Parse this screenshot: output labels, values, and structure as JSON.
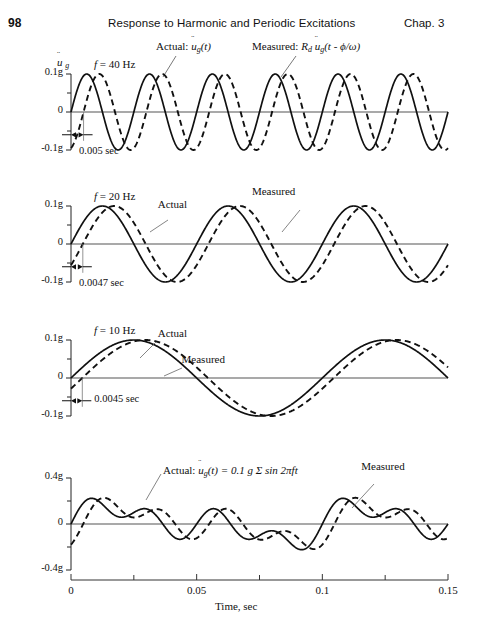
{
  "page": {
    "folio": "98",
    "running_title": "Response to Harmonic and Periodic Excitations",
    "chapter": "Chap. 3"
  },
  "legend": {
    "actual_prefix": "Actual:",
    "actual_symbol_u": "u",
    "actual_symbol_sub": "g",
    "actual_symbol_arg": "(t)",
    "measured_prefix": "Measured:",
    "measured_rd": "R",
    "measured_rd_sub": "d",
    "measured_symbol_u": "u",
    "measured_symbol_sub": "g",
    "measured_symbol_arg": "(t - ϕ/ω)"
  },
  "axis": {
    "x_title": "Time, sec",
    "x_ticks": [
      "0",
      "0.05",
      "0.1",
      "0.15"
    ],
    "x_tick_values": [
      0,
      0.05,
      0.1,
      0.15
    ],
    "x_minor_values": [
      0.025,
      0.075,
      0.125
    ],
    "x_min": 0,
    "x_max": 0.15,
    "y_name_u": "u",
    "y_name_sub": "g"
  },
  "chart_data": [
    {
      "id": "panel-40hz",
      "type": "line",
      "title": "f = 40 Hz",
      "freq_label_prefix": "f",
      "freq_label_value": "= 40 Hz",
      "frequency_hz": 40,
      "amplitude_g": 0.1,
      "phase_shift_sec": 0.005,
      "shift_label": "0.005 sec",
      "xlabel": "",
      "ylabel": "",
      "xlim": [
        0,
        0.15
      ],
      "ylim": [
        -0.1,
        0.1
      ],
      "y_ticks": [
        "0.1g",
        "0",
        "-0.1g"
      ],
      "y_tick_values": [
        0.1,
        0,
        -0.1
      ],
      "y_minor_values": [
        0.05,
        -0.05
      ],
      "grid": false,
      "series": [
        {
          "name": "Actual",
          "style": "solid",
          "type": "sine",
          "amplitude": 0.1,
          "freq": 40,
          "shift": 0
        },
        {
          "name": "Measured",
          "style": "dashed",
          "type": "sine",
          "amplitude": 0.1,
          "freq": 40,
          "shift": 0.005
        }
      ],
      "annotations": []
    },
    {
      "id": "panel-20hz",
      "type": "line",
      "title": "f = 20 Hz",
      "freq_label_prefix": "f",
      "freq_label_value": "= 20 Hz",
      "frequency_hz": 20,
      "amplitude_g": 0.1,
      "phase_shift_sec": 0.0047,
      "shift_label": "0.0047 sec",
      "xlabel": "",
      "ylabel": "",
      "xlim": [
        0,
        0.15
      ],
      "ylim": [
        -0.1,
        0.1
      ],
      "y_ticks": [
        "0.1g",
        "0",
        "-0.1g"
      ],
      "y_tick_values": [
        0.1,
        0,
        -0.1
      ],
      "y_minor_values": [
        0.05,
        -0.05
      ],
      "grid": false,
      "series": [
        {
          "name": "Actual",
          "style": "solid",
          "type": "sine",
          "amplitude": 0.1,
          "freq": 20,
          "shift": 0
        },
        {
          "name": "Measured",
          "style": "dashed",
          "type": "sine",
          "amplitude": 0.1,
          "freq": 20,
          "shift": 0.0047
        }
      ],
      "annotations": [
        {
          "text": "Actual",
          "x": 0.0345,
          "y": 0.12
        },
        {
          "text": "Measured",
          "x": 0.072,
          "y": 0.155
        }
      ]
    },
    {
      "id": "panel-10hz",
      "type": "line",
      "title": "f = 10 Hz",
      "freq_label_prefix": "f",
      "freq_label_value": "= 10 Hz",
      "frequency_hz": 10,
      "amplitude_g": 0.1,
      "phase_shift_sec": 0.0045,
      "shift_label": "0.0045 sec",
      "xlabel": "",
      "ylabel": "",
      "xlim": [
        0,
        0.15
      ],
      "ylim": [
        -0.1,
        0.1
      ],
      "y_ticks": [
        "0.1g",
        "0",
        "-0.1g"
      ],
      "y_tick_values": [
        0.1,
        0,
        -0.1
      ],
      "y_minor_values": [
        0.05,
        -0.05
      ],
      "grid": false,
      "series": [
        {
          "name": "Actual",
          "style": "solid",
          "type": "sine",
          "amplitude": 0.1,
          "freq": 10,
          "shift": 0
        },
        {
          "name": "Measured",
          "style": "dashed",
          "type": "sine",
          "amplitude": 0.1,
          "freq": 10,
          "shift": 0.0045
        }
      ],
      "annotations": [
        {
          "text": "Actual",
          "x": 0.0345,
          "y": 0.135
        },
        {
          "text": "Measured",
          "x": 0.044,
          "y": 0.065
        }
      ]
    },
    {
      "id": "panel-sum",
      "type": "line",
      "title": "Actual: u_g(t) = 0.1 g Σ sin 2πft",
      "freq_label_prefix": "",
      "freq_label_value": "",
      "amplitude_g": 0.4,
      "shift_label": "",
      "xlabel": "Time, sec",
      "ylabel": "",
      "xlim": [
        0,
        0.15
      ],
      "ylim": [
        -0.4,
        0.4
      ],
      "y_ticks": [
        "0.4g",
        "0",
        "-0.4g"
      ],
      "y_tick_values": [
        0.4,
        0,
        -0.4
      ],
      "y_minor_values": [
        0.2,
        -0.2
      ],
      "grid": false,
      "equation_prefix": "Actual:",
      "equation_u": "u",
      "equation_sub": "g",
      "equation_rest": "(t) = 0.1 g Σ sin 2πft",
      "measured_label": "Measured",
      "series": [
        {
          "name": "Actual",
          "style": "solid",
          "type": "sum",
          "amplitude": 0.1,
          "components": [
            {
              "freq": 40,
              "shift": 0
            },
            {
              "freq": 20,
              "shift": 0
            },
            {
              "freq": 10,
              "shift": 0
            }
          ]
        },
        {
          "name": "Measured",
          "style": "dashed",
          "type": "sum",
          "amplitude": 0.1,
          "components": [
            {
              "freq": 40,
              "shift": 0.005
            },
            {
              "freq": 20,
              "shift": 0.0047
            },
            {
              "freq": 10,
              "shift": 0.0045
            }
          ]
        }
      ],
      "annotations": [
        {
          "text": "Measured",
          "x": 0.1155,
          "y": 0.56
        }
      ]
    }
  ],
  "panel_geometry": [
    {
      "top": 62,
      "height": 100,
      "plot_top": 12,
      "plot_height": 76
    },
    {
      "top": 188,
      "height": 104,
      "plot_top": 18,
      "plot_height": 76
    },
    {
      "top": 322,
      "height": 104,
      "plot_top": 18,
      "plot_height": 76
    },
    {
      "top": 462,
      "height": 120,
      "plot_top": 16,
      "plot_height": 92
    }
  ]
}
